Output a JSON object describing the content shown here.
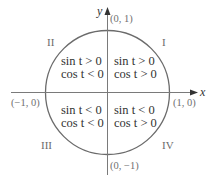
{
  "diagram": {
    "type": "unit-circle-sign-quadrants",
    "axes": {
      "x_label": "x",
      "y_label": "y"
    },
    "points": {
      "top": "(0, 1)",
      "right": "(1, 0)",
      "bottom": "(0, −1)",
      "left": "(−1, 0)"
    },
    "quadrants": {
      "I": {
        "label": "I",
        "sin": "sin t > 0",
        "cos": "cos t > 0"
      },
      "II": {
        "label": "II",
        "sin": "sin t > 0",
        "cos": "cos t < 0"
      },
      "III": {
        "label": "III",
        "sin": "sin t < 0",
        "cos": "cos t < 0"
      },
      "IV": {
        "label": "IV",
        "sin": "sin t < 0",
        "cos": "cos t > 0"
      }
    },
    "colors": {
      "circle": "#6b6b6b",
      "axes": "#7a7a7a",
      "arrow": "#333333",
      "text": "#333333",
      "muted_text": "#707070"
    }
  }
}
